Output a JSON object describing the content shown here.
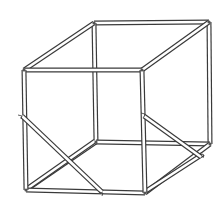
{
  "figure": {
    "colors": {
      "background": "#ffffff",
      "ink": "#3a3a3a",
      "rod_interior": "#ffffff",
      "shading": "#d9d9d9"
    },
    "parts": {
      "frame_edges": [
        "top-front-edge",
        "top-left-edge",
        "top-back-edge",
        "top-right-edge",
        "front-left-post",
        "front-right-post",
        "back-left-post",
        "back-right-post",
        "bottom-front-edge",
        "bottom-left-edge",
        "bottom-back-edge",
        "bottom-right-edge"
      ],
      "braces": [
        "left-side-diagonal-brace",
        "left-floor-diagonal-brace",
        "right-side-diagonal-brace",
        "right-floor-diagonal-brace"
      ]
    },
    "caption": ""
  }
}
